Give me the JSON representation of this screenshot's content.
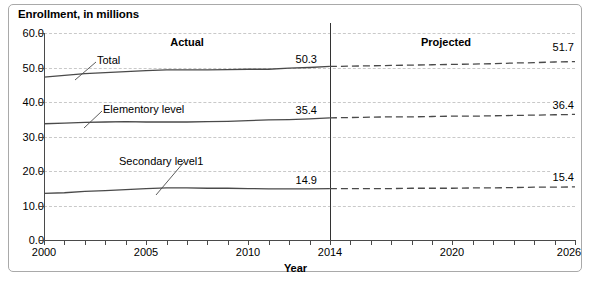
{
  "chart_title": "Enrollment, in millions",
  "axis": {
    "x_title": "Year",
    "x_ticks": [
      "2000",
      "2005",
      "2010",
      "2014",
      "2020",
      "2026"
    ],
    "y_ticks": [
      "60.0",
      "50.0",
      "40.0",
      "30.0",
      "20.0",
      "10.0",
      "0.0"
    ]
  },
  "annotations": {
    "actual": "Actual",
    "projected": "Projected",
    "divider_year": "2014"
  },
  "series_labels": {
    "total": "Total",
    "elementary": "Elementory level",
    "secondary": "Secondary level1"
  },
  "value_labels": {
    "total_2014": "50.3",
    "elementary_2014": "35.4",
    "secondary_2014": "14.9",
    "total_2026": "51.7",
    "elementary_2026": "36.4",
    "secondary_2026": "15.4"
  },
  "colors": {
    "line": "#4a4a4a",
    "grid": "#c9c9c9",
    "divider": "#333333",
    "frame": "#a9a9a9",
    "text": "#000000"
  },
  "chart_data": {
    "type": "line",
    "title": "Enrollment, in millions",
    "xlabel": "Year",
    "ylabel": "Enrollment, in millions",
    "xlim": [
      2000,
      2026
    ],
    "ylim": [
      0,
      60
    ],
    "ytick_step": 10,
    "grid": true,
    "legend": "inline-labels",
    "actual_through": 2014,
    "projected_from": 2014,
    "x": [
      2000,
      2001,
      2002,
      2003,
      2004,
      2005,
      2006,
      2007,
      2008,
      2009,
      2010,
      2011,
      2012,
      2013,
      2014,
      2015,
      2016,
      2017,
      2018,
      2019,
      2020,
      2021,
      2022,
      2023,
      2024,
      2025,
      2026
    ],
    "series": [
      {
        "name": "Total",
        "style": "solid-then-dashed",
        "values": [
          47.2,
          47.7,
          48.2,
          48.5,
          48.8,
          49.1,
          49.3,
          49.3,
          49.3,
          49.4,
          49.5,
          49.5,
          49.8,
          50.0,
          50.3,
          50.4,
          50.5,
          50.6,
          50.7,
          50.8,
          50.9,
          51.0,
          51.1,
          51.3,
          51.4,
          51.6,
          51.7
        ],
        "label_2014": 50.3,
        "label_2026": 51.7
      },
      {
        "name": "Elementory level",
        "style": "solid-then-dashed",
        "values": [
          33.7,
          33.9,
          34.1,
          34.2,
          34.3,
          34.2,
          34.2,
          34.2,
          34.3,
          34.4,
          34.6,
          34.8,
          34.9,
          35.1,
          35.4,
          35.5,
          35.6,
          35.7,
          35.7,
          35.8,
          35.9,
          35.9,
          36.0,
          36.1,
          36.2,
          36.3,
          36.4
        ],
        "label_2014": 35.4,
        "label_2026": 36.4
      },
      {
        "name": "Secondary level1",
        "style": "solid-then-dashed",
        "values": [
          13.5,
          13.7,
          14.1,
          14.3,
          14.6,
          14.9,
          15.1,
          15.1,
          15.0,
          15.0,
          14.9,
          14.8,
          14.8,
          14.8,
          14.9,
          14.9,
          14.9,
          14.9,
          15.0,
          15.0,
          15.0,
          15.1,
          15.1,
          15.2,
          15.3,
          15.3,
          15.4
        ],
        "label_2014": 14.9,
        "label_2026": 15.4
      }
    ]
  }
}
